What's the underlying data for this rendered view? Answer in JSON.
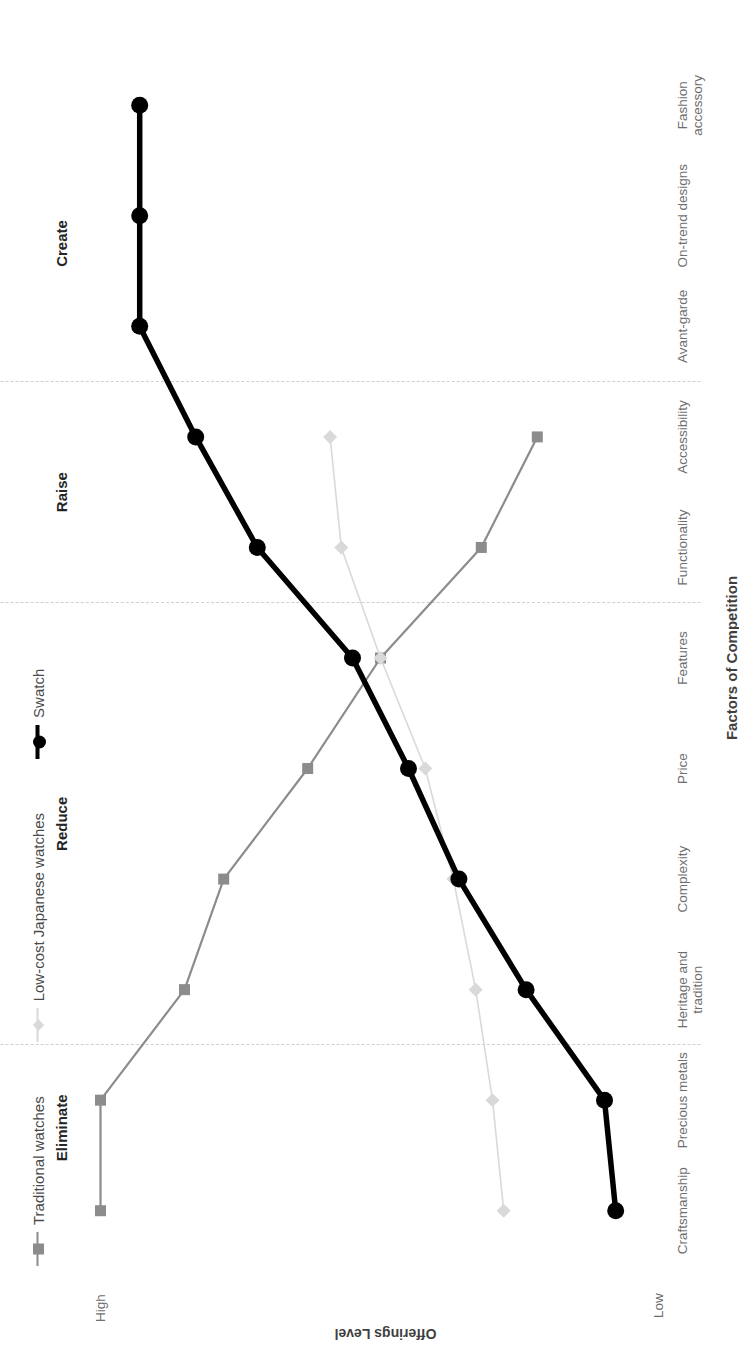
{
  "chart_data": {
    "type": "line",
    "title": "",
    "xlabel": "Factors of Competition",
    "ylabel": "Offerings Level",
    "ylim_labels": [
      "Low",
      "High"
    ],
    "grid": true,
    "legend_position": "top-left",
    "categories": [
      "Craftsmanship",
      "Precious metals",
      "Heritage and\ntradition",
      "Complexity",
      "Price",
      "Features",
      "Functionality",
      "Accessibility",
      "Avant-garde",
      "On-trend designs",
      "Fashion\naccessory"
    ],
    "series": [
      {
        "name": "Traditional watches",
        "color": "#8c8c8c",
        "marker": "square",
        "values": [
          100,
          100,
          85,
          78,
          63,
          50,
          32,
          22,
          null,
          null,
          null
        ]
      },
      {
        "name": "Low-cost Japanese watches",
        "color": "#d9d9d9",
        "marker": "diamond",
        "values": [
          28,
          30,
          33,
          37,
          42,
          50,
          57,
          59,
          null,
          null,
          null
        ]
      },
      {
        "name": "Swatch",
        "color": "#000000",
        "marker": "circle",
        "values": [
          8,
          10,
          24,
          36,
          45,
          55,
          72,
          83,
          93,
          93,
          93
        ]
      }
    ],
    "bands": [
      {
        "label": "Eliminate",
        "from": 0,
        "to": 1.5
      },
      {
        "label": "Reduce",
        "from": 1.5,
        "to": 5.5
      },
      {
        "label": "Raise",
        "from": 5.5,
        "to": 7.5
      },
      {
        "label": "Create",
        "from": 7.5,
        "to": 10
      }
    ],
    "band_dividers": [
      1.5,
      5.5,
      7.5
    ]
  },
  "axis": {
    "y_high": "High",
    "y_low": "Low",
    "y_title": "Offerings Level",
    "x_title": "Factors of Competition"
  },
  "legend": {
    "items": [
      {
        "label": "Traditional watches"
      },
      {
        "label": "Low-cost Japanese watches"
      },
      {
        "label": "Swatch"
      }
    ]
  }
}
